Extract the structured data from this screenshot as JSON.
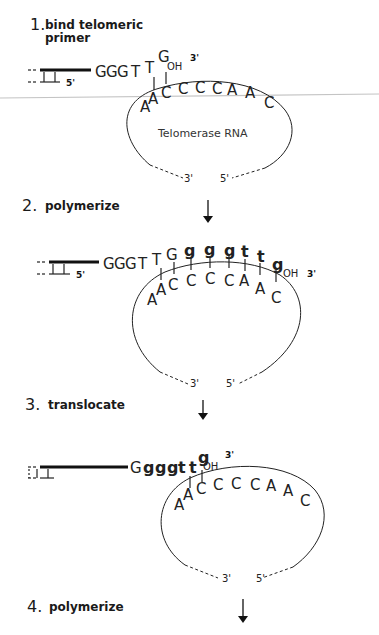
{
  "diagram": {
    "steps": [
      {
        "number": "1.",
        "label_line1": "bind telomeric",
        "label_line2": "primer",
        "primer_sequence": [
          "G",
          "G",
          "G",
          "T",
          "T",
          "G"
        ],
        "oh_label": "OH",
        "three_prime": "3'",
        "five_prime": "5'",
        "template": [
          "A",
          "A",
          "C",
          "C",
          "C",
          "C",
          "A",
          "A",
          "C"
        ],
        "rna_label": "Telomerase RNA",
        "rna_3prime": "3'",
        "rna_5prime": "5'"
      },
      {
        "number": "2.",
        "label": "polymerize",
        "primer_sequence": [
          "G",
          "G",
          "G",
          "T",
          "T",
          "G"
        ],
        "added_sequence": [
          "g",
          "g",
          "g",
          "t",
          "t",
          "g"
        ],
        "oh_label": "OH",
        "three_prime": "3'",
        "five_prime": "5'",
        "template": [
          "A",
          "A",
          "C",
          "C",
          "C",
          "C",
          "A",
          "A",
          "C"
        ],
        "rna_3prime": "3'",
        "rna_5prime": "5'"
      },
      {
        "number": "3.",
        "label": "translocate",
        "primer_sequence": [
          "G",
          "g",
          "g",
          "g",
          "t",
          "t",
          "g"
        ],
        "oh_label": "OH",
        "three_prime": "3'",
        "template": [
          "A",
          "A",
          "C",
          "C",
          "C",
          "C",
          "A",
          "A",
          "C"
        ],
        "rna_3prime": "3'",
        "rna_5prime": "5'"
      },
      {
        "number": "4.",
        "label": "polymerize"
      }
    ],
    "colors": {
      "ink": "#1a1a1a",
      "background": "#ffffff",
      "scan_line": "#bdbdbd"
    }
  }
}
